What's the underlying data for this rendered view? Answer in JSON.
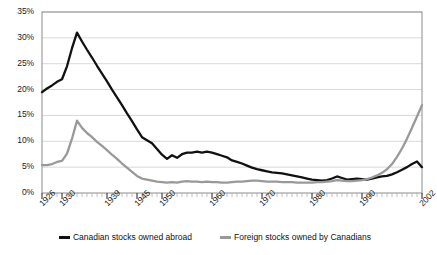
{
  "chart_data": {
    "type": "line",
    "title": "",
    "subtitle": "",
    "xlabel": "",
    "ylabel": "",
    "xlim": [
      1926,
      2002
    ],
    "ylim": [
      0,
      35
    ],
    "ytick_labels": [
      "35%",
      "30%",
      "25%",
      "20%",
      "15%",
      "10%",
      "5%",
      "0%"
    ],
    "ytick_values": [
      35,
      30,
      25,
      20,
      15,
      10,
      5,
      0
    ],
    "xtick_labels": [
      "1926",
      "1930",
      "1939",
      "1945",
      "1950",
      "1960",
      "1970",
      "1980",
      "1990",
      "2002"
    ],
    "xtick_values": [
      1926,
      1930,
      1939,
      1945,
      1950,
      1960,
      1970,
      1980,
      1990,
      2002
    ],
    "grid": true,
    "grid_axis": "y",
    "legend_position": "bottom",
    "minor_ticks": "annual",
    "colors": {
      "series_1": "#111111",
      "series_2": "#999999",
      "grid": "#d9d9d9",
      "axis": "#8c8c8c",
      "background": "#ffffff"
    },
    "series": [
      {
        "name": "Canadian stocks owned abroad",
        "color": "#111111",
        "x": [
          1926,
          1927,
          1928,
          1929,
          1930,
          1931,
          1932,
          1933,
          1934,
          1935,
          1936,
          1937,
          1938,
          1939,
          1940,
          1941,
          1942,
          1943,
          1944,
          1945,
          1946,
          1947,
          1948,
          1949,
          1950,
          1951,
          1952,
          1953,
          1954,
          1955,
          1956,
          1957,
          1958,
          1959,
          1960,
          1961,
          1962,
          1963,
          1964,
          1965,
          1966,
          1967,
          1968,
          1969,
          1970,
          1971,
          1972,
          1973,
          1974,
          1975,
          1976,
          1977,
          1978,
          1979,
          1980,
          1981,
          1982,
          1983,
          1984,
          1985,
          1986,
          1987,
          1988,
          1989,
          1990,
          1991,
          1992,
          1993,
          1994,
          1995,
          1996,
          1997,
          1998,
          1999,
          2000,
          2001,
          2002
        ],
        "values": [
          19.5,
          20.2,
          20.8,
          21.5,
          22.0,
          24.5,
          28.0,
          31.0,
          29.3,
          27.7,
          26.2,
          24.6,
          23.1,
          21.6,
          20.0,
          18.5,
          17.0,
          15.4,
          13.9,
          12.3,
          10.8,
          10.2,
          9.6,
          8.5,
          7.4,
          6.6,
          7.3,
          6.8,
          7.5,
          7.8,
          7.8,
          8.0,
          7.8,
          8.0,
          7.8,
          7.5,
          7.2,
          6.9,
          6.3,
          6.0,
          5.7,
          5.3,
          4.9,
          4.6,
          4.4,
          4.2,
          4.0,
          3.9,
          3.8,
          3.6,
          3.4,
          3.2,
          3.0,
          2.8,
          2.6,
          2.5,
          2.4,
          2.5,
          2.8,
          3.2,
          2.9,
          2.6,
          2.7,
          2.8,
          2.7,
          2.6,
          2.8,
          3.0,
          3.2,
          3.3,
          3.6,
          4.0,
          4.5,
          5.0,
          5.6,
          6.1,
          5.0
        ]
      },
      {
        "name": "Foreign stocks owned by Canadians",
        "color": "#999999",
        "x": [
          1926,
          1927,
          1928,
          1929,
          1930,
          1931,
          1932,
          1933,
          1934,
          1935,
          1936,
          1937,
          1938,
          1939,
          1940,
          1941,
          1942,
          1943,
          1944,
          1945,
          1946,
          1947,
          1948,
          1949,
          1950,
          1951,
          1952,
          1953,
          1954,
          1955,
          1956,
          1957,
          1958,
          1959,
          1960,
          1961,
          1962,
          1963,
          1964,
          1965,
          1966,
          1967,
          1968,
          1969,
          1970,
          1971,
          1972,
          1973,
          1974,
          1975,
          1976,
          1977,
          1978,
          1979,
          1980,
          1981,
          1982,
          1983,
          1984,
          1985,
          1986,
          1987,
          1988,
          1989,
          1990,
          1991,
          1992,
          1993,
          1994,
          1995,
          1996,
          1997,
          1998,
          1999,
          2000,
          2001,
          2002
        ],
        "values": [
          5.4,
          5.4,
          5.6,
          6.0,
          6.2,
          7.6,
          10.5,
          14.0,
          12.6,
          11.6,
          10.8,
          9.9,
          9.1,
          8.3,
          7.4,
          6.6,
          5.7,
          4.9,
          4.1,
          3.3,
          2.8,
          2.6,
          2.4,
          2.2,
          2.1,
          2.0,
          2.1,
          2.0,
          2.2,
          2.3,
          2.2,
          2.2,
          2.1,
          2.2,
          2.1,
          2.1,
          2.0,
          2.0,
          2.1,
          2.2,
          2.2,
          2.3,
          2.4,
          2.4,
          2.3,
          2.2,
          2.2,
          2.2,
          2.1,
          2.1,
          2.1,
          2.0,
          2.0,
          2.0,
          2.0,
          2.1,
          2.1,
          2.2,
          2.3,
          2.5,
          2.4,
          2.3,
          2.3,
          2.4,
          2.5,
          2.7,
          3.0,
          3.4,
          3.9,
          4.6,
          5.6,
          7.0,
          8.6,
          10.5,
          12.6,
          14.8,
          17.0
        ]
      }
    ]
  },
  "legend": {
    "items": [
      {
        "label": "Canadian stocks owned abroad"
      },
      {
        "label": "Foreign stocks owned by Canadians"
      }
    ]
  }
}
